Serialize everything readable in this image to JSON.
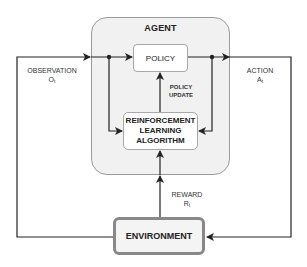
{
  "diagram": {
    "agent": {
      "title": "AGENT"
    },
    "policy": {
      "label": "POLICY"
    },
    "rl_algorithm": {
      "line1": "REINFORCEMENT",
      "line2": "LEARNING",
      "line3": "ALGORITHM"
    },
    "environment": {
      "label": "ENVIRONMENT"
    },
    "edges": {
      "observation": {
        "label": "OBSERVATION",
        "symbol": "O",
        "subscript": "t"
      },
      "action": {
        "label": "ACTION",
        "symbol": "A",
        "subscript": "t"
      },
      "reward": {
        "label": "REWARD",
        "symbol": "R",
        "subscript": "t"
      },
      "policy_update": {
        "line1": "POLICY",
        "line2": "UPDATE"
      }
    },
    "colors": {
      "line": "#222222",
      "agent_fill": "#f1f1f1",
      "agent_border": "#9a9a9a",
      "env_border": "#888888"
    }
  }
}
